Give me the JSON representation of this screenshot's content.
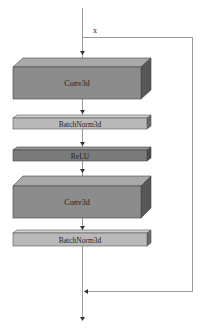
{
  "diagram": {
    "type": "residual-block",
    "input_label": "x",
    "layers": [
      {
        "id": "conv1",
        "label": "Conv3d",
        "kind": "conv"
      },
      {
        "id": "bn1",
        "label": "BatchNorm3d",
        "kind": "norm"
      },
      {
        "id": "relu",
        "label": "ReLU",
        "kind": "activation"
      },
      {
        "id": "conv2",
        "label": "Conv3d",
        "kind": "conv"
      },
      {
        "id": "bn2",
        "label": "BatchNorm3d",
        "kind": "norm"
      }
    ],
    "connections": [
      {
        "from": "input",
        "to": "conv1"
      },
      {
        "from": "conv1",
        "to": "bn1"
      },
      {
        "from": "bn1",
        "to": "relu"
      },
      {
        "from": "relu",
        "to": "conv2"
      },
      {
        "from": "conv2",
        "to": "bn2"
      },
      {
        "from": "bn2",
        "to": "add"
      },
      {
        "from": "input",
        "to": "add",
        "type": "skip"
      },
      {
        "from": "add",
        "to": "output"
      }
    ],
    "colors": {
      "conv_front": "#8c8c8c",
      "conv_top": "#a9a9a9",
      "conv_side": "#575757",
      "norm_front": "#b9b9b9",
      "norm_top": "#d2d2d2",
      "norm_side": "#6a6a6a",
      "relu_front": "#7b7b7b",
      "relu_top": "#979797",
      "relu_side": "#4e4e4e",
      "line": "#9a9a9a",
      "arrow": "#333333"
    }
  }
}
